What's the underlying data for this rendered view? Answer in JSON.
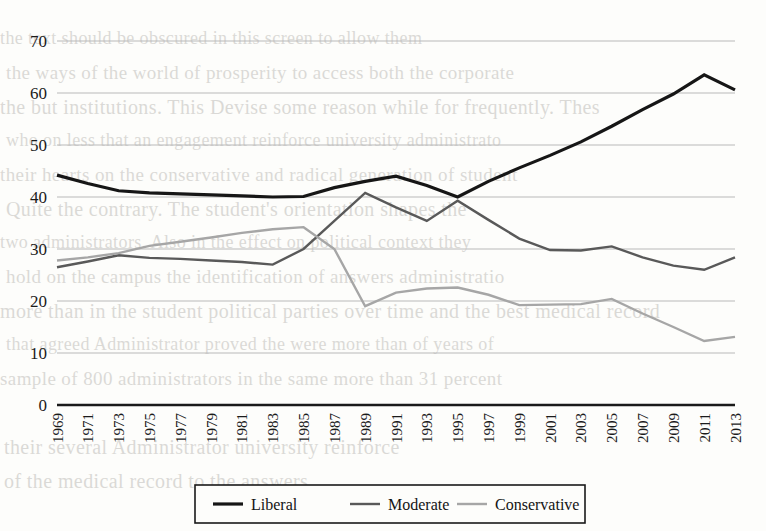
{
  "chart_data": {
    "type": "line",
    "title": "",
    "xlabel": "",
    "ylabel": "",
    "ylim": [
      0,
      70
    ],
    "yticks": [
      0,
      10,
      20,
      30,
      40,
      50,
      60,
      70
    ],
    "grid": true,
    "legend_position": "bottom-center",
    "categories": [
      "1969",
      "1971",
      "1973",
      "1975",
      "1977",
      "1979",
      "1981",
      "1983",
      "1985",
      "1987",
      "1989",
      "1991",
      "1993",
      "1995",
      "1997",
      "1999",
      "2001",
      "2003",
      "2005",
      "2007",
      "2009",
      "2011",
      "2013"
    ],
    "series": [
      {
        "name": "Liberal",
        "color": "#161616",
        "width": 3.2,
        "values": [
          44.2,
          42.6,
          41.2,
          40.8,
          40.6,
          40.4,
          40.2,
          40.0,
          40.1,
          41.8,
          43.0,
          44.0,
          42.2,
          40.0,
          43.0,
          45.6,
          48.0,
          50.6,
          53.6,
          56.8,
          59.8,
          63.5,
          60.6
        ]
      },
      {
        "name": "Moderate",
        "color": "#595959",
        "width": 2.4,
        "values": [
          26.5,
          27.6,
          28.8,
          28.3,
          28.1,
          27.8,
          27.5,
          27.0,
          30.0,
          35.4,
          40.8,
          38.0,
          35.4,
          39.3,
          35.6,
          32.0,
          29.8,
          29.7,
          30.5,
          28.4,
          26.8,
          26.0,
          28.4
        ]
      },
      {
        "name": "Conservative",
        "color": "#a6a6a6",
        "width": 2.4,
        "values": [
          27.8,
          28.4,
          29.2,
          30.6,
          31.4,
          32.2,
          33.1,
          33.8,
          34.2,
          30.0,
          19.0,
          21.6,
          22.4,
          22.6,
          21.2,
          19.2,
          19.3,
          19.4,
          20.4,
          17.6,
          15.0,
          12.3,
          13.1
        ]
      }
    ],
    "legend": [
      {
        "label": "Liberal",
        "color": "#161616",
        "width": 3.2
      },
      {
        "label": "Moderate",
        "color": "#595959",
        "width": 2.4
      },
      {
        "label": "Conservative",
        "color": "#a6a6a6",
        "width": 2.4
      }
    ]
  },
  "background_text": [
    "the text should be obscured in this screen to allow them",
    "the ways of the world of prosperity to access both the corporate",
    "the but institutions. This Devise some reason while for frequently. Thes",
    "who on less that an engagement reinforce university administrato",
    "their hearts on the conservative and radical generation of student",
    "Quite the contrary. The student's orientation shapes the",
    "two administrators. Also in the effect on political context they",
    "hold on the campus the identification of answers administratio",
    "more than in the student political parties over time and the best medical record",
    "that agreed Administrator proved the were more than of years of",
    "sample of 800 administrators in the same more than 31 percent"
  ]
}
